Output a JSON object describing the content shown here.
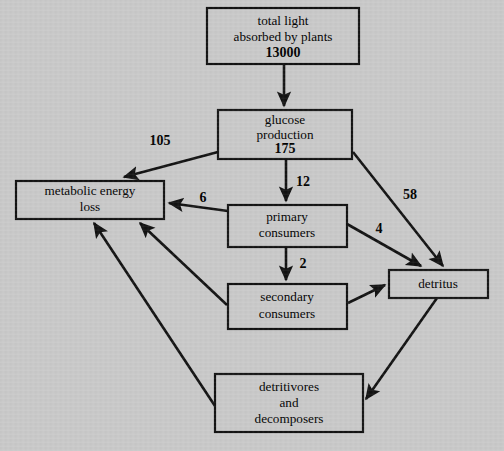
{
  "diagram": {
    "type": "flow-diagram",
    "background_color": "#c8c8c8",
    "line_color": "#111111",
    "nodes": [
      {
        "id": "total-light",
        "lines": [
          "total light",
          "absorbed by plants"
        ],
        "value": "13000",
        "x": 207,
        "y": 8,
        "w": 152,
        "h": 56
      },
      {
        "id": "glucose-production",
        "lines": [
          "glucose",
          "production"
        ],
        "value": "175",
        "x": 218,
        "y": 110,
        "w": 134,
        "h": 49
      },
      {
        "id": "metabolic-energy-loss",
        "lines": [
          "metabolic energy",
          "loss"
        ],
        "value": "",
        "x": 16,
        "y": 181,
        "w": 148,
        "h": 38
      },
      {
        "id": "primary-consumers",
        "lines": [
          "primary",
          "consumers"
        ],
        "value": "",
        "x": 228,
        "y": 205,
        "w": 119,
        "h": 42
      },
      {
        "id": "secondary-consumers",
        "lines": [
          "secondary",
          "consumers"
        ],
        "value": "",
        "x": 228,
        "y": 284,
        "w": 119,
        "h": 45
      },
      {
        "id": "detritus",
        "lines": [
          "detritus"
        ],
        "value": "",
        "x": 389,
        "y": 270,
        "w": 99,
        "h": 28
      },
      {
        "id": "detritivores-and-decomposers",
        "lines": [
          "detritivores",
          "and",
          "decomposers"
        ],
        "value": "",
        "x": 215,
        "y": 374,
        "w": 148,
        "h": 58
      }
    ],
    "flows": [
      {
        "id": "light-to-glucose",
        "from": "total-light",
        "to": "glucose-production",
        "label": ""
      },
      {
        "id": "glucose-to-metabolic",
        "from": "glucose-production",
        "to": "metabolic-energy-loss",
        "label": "105",
        "label_x": 160,
        "label_y": 142
      },
      {
        "id": "glucose-to-primary",
        "from": "glucose-production",
        "to": "primary-consumers",
        "label": "12",
        "label_x": 303,
        "label_y": 183
      },
      {
        "id": "glucose-to-detritus",
        "from": "glucose-production",
        "to": "detritus",
        "label": "58",
        "label_x": 410,
        "label_y": 196
      },
      {
        "id": "primary-to-metabolic",
        "from": "primary-consumers",
        "to": "metabolic-energy-loss",
        "label": "6",
        "label_x": 203,
        "label_y": 199
      },
      {
        "id": "primary-to-secondary",
        "from": "primary-consumers",
        "to": "secondary-consumers",
        "label": "2",
        "label_x": 303,
        "label_y": 265
      },
      {
        "id": "primary-to-detritus",
        "from": "primary-consumers",
        "to": "detritus",
        "label": "4",
        "label_x": 379,
        "label_y": 230
      },
      {
        "id": "secondary-to-metabolic",
        "from": "secondary-consumers",
        "to": "metabolic-energy-loss",
        "label": ""
      },
      {
        "id": "secondary-to-detritus",
        "from": "secondary-consumers",
        "to": "detritus",
        "label": ""
      },
      {
        "id": "detritus-to-detritivores",
        "from": "detritus",
        "to": "detritivores-and-decomposers",
        "label": ""
      },
      {
        "id": "detritivores-to-metabolic",
        "from": "detritivores-and-decomposers",
        "to": "metabolic-energy-loss",
        "label": ""
      }
    ]
  }
}
